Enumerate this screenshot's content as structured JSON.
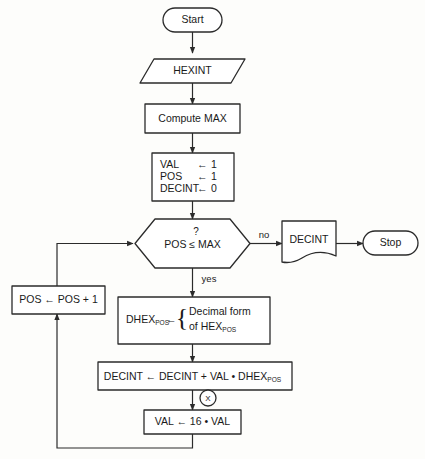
{
  "diagram": {
    "stroke_color": "#2b2b2b",
    "fill_color": "#ffffff",
    "background_color": "#fdfdfb"
  },
  "nodes": {
    "start": {
      "label": "Start",
      "shape": "terminator"
    },
    "input_hexint": {
      "label": "HEXINT",
      "shape": "parallelogram-input"
    },
    "compute_max": {
      "label": "Compute MAX",
      "shape": "process"
    },
    "init": {
      "shape": "process",
      "lines": [
        {
          "var": "VAL",
          "arrow": "←",
          "value": "1"
        },
        {
          "var": "POS",
          "arrow": "←",
          "value": "1"
        },
        {
          "var": "DECINT",
          "arrow": "←",
          "value": "0"
        }
      ]
    },
    "decision": {
      "shape": "hexagon",
      "question_mark": "?",
      "condition": "POS ≤ MAX",
      "cond_left": "POS",
      "cond_op": "≤",
      "cond_right": "MAX",
      "yes_label": "yes",
      "no_label": "no"
    },
    "output_decint": {
      "label": "DECINT",
      "shape": "document"
    },
    "stop": {
      "label": "Stop",
      "shape": "terminator"
    },
    "pos_increment": {
      "label": "POS ← POS + 1",
      "shape": "process"
    },
    "dhex_assign": {
      "shape": "process",
      "lhs": "DHEX",
      "lhs_sub": "POS",
      "arrow": "←",
      "brace": "{",
      "rhs_line1": "Decimal form",
      "rhs_line2_pre": "of HEX",
      "rhs_line2_sub": "POS"
    },
    "decint_accum": {
      "shape": "process",
      "text_pre": "DECINT  ←  DECINT  +  VAL • DHEX",
      "text_sub": "POS"
    },
    "val_update": {
      "label": "VAL ← 16 • VAL",
      "shape": "process"
    },
    "connector_x": {
      "label": "X",
      "shape": "circle-connector"
    }
  },
  "edges": [
    {
      "from": "start",
      "to": "input_hexint",
      "label": ""
    },
    {
      "from": "input_hexint",
      "to": "compute_max",
      "label": ""
    },
    {
      "from": "compute_max",
      "to": "init",
      "label": ""
    },
    {
      "from": "init",
      "to": "decision",
      "label": ""
    },
    {
      "from": "decision",
      "to": "output_decint",
      "label": "no"
    },
    {
      "from": "output_decint",
      "to": "stop",
      "label": ""
    },
    {
      "from": "decision",
      "to": "dhex_assign",
      "label": "yes"
    },
    {
      "from": "dhex_assign",
      "to": "decint_accum",
      "label": ""
    },
    {
      "from": "decint_accum",
      "to": "val_update",
      "label": ""
    },
    {
      "from": "val_update",
      "to": "pos_increment",
      "label": ""
    },
    {
      "from": "pos_increment",
      "to": "decision",
      "label": ""
    }
  ]
}
